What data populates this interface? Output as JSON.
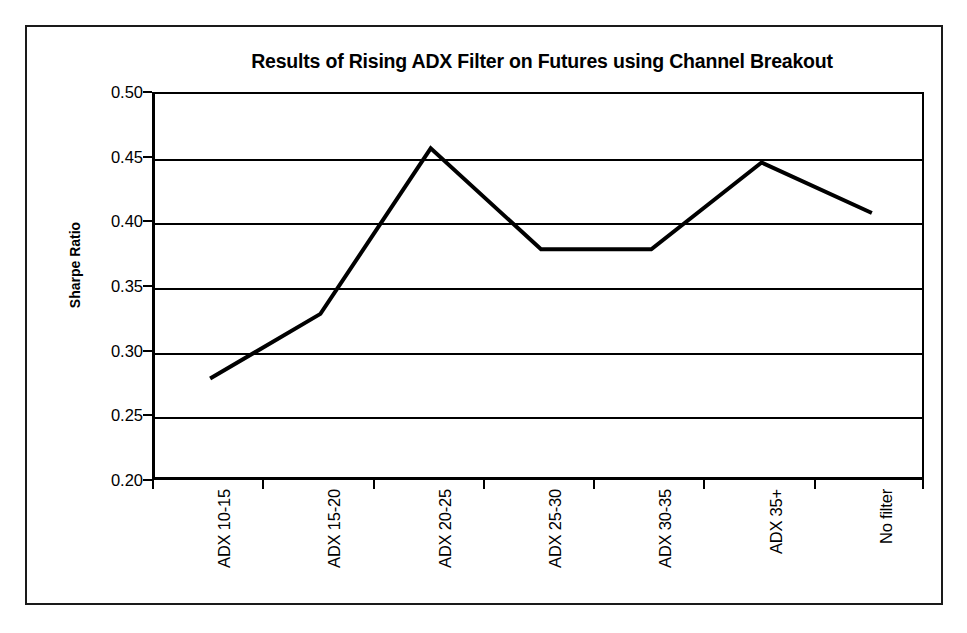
{
  "chart_data": {
    "type": "line",
    "title": "Results of Rising ADX Filter on Futures using Channel Breakout",
    "xlabel": "",
    "ylabel": "Sharpe Ratio",
    "categories": [
      "ADX 10-15",
      "ADX 15-20",
      "ADX 20-25",
      "ADX 25-30",
      "ADX 30-35",
      "ADX 35+",
      "No filter"
    ],
    "values": [
      0.28,
      0.33,
      0.458,
      0.38,
      0.38,
      0.447,
      0.408
    ],
    "series": [
      {
        "name": "Sharpe Ratio",
        "values": [
          0.28,
          0.33,
          0.458,
          0.38,
          0.38,
          0.447,
          0.408
        ]
      }
    ],
    "ylim": [
      0.2,
      0.5
    ],
    "ytick_labels": [
      "0.50",
      "0.45",
      "0.40",
      "0.35",
      "0.30",
      "0.25",
      "0.20"
    ],
    "ytick_values": [
      0.5,
      0.45,
      0.4,
      0.35,
      0.3,
      0.25,
      0.2
    ],
    "grid": true,
    "legend": false,
    "legend_position": "none",
    "line_color": "#000000",
    "background_color": "#ffffff",
    "border_color": "#1a1a1a",
    "markers": false
  }
}
